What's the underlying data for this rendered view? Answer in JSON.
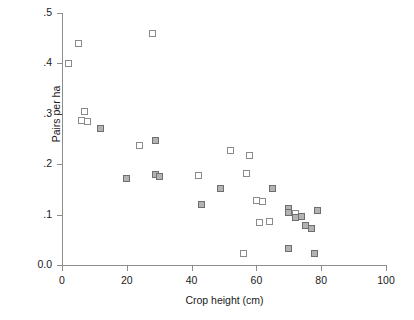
{
  "chart_data": {
    "type": "scatter",
    "title": "",
    "xlabel": "Crop height (cm)",
    "ylabel": "Pairs per ha",
    "xlim": [
      0,
      100
    ],
    "ylim": [
      0.0,
      0.5
    ],
    "xticks": [
      0,
      20,
      40,
      60,
      80,
      100
    ],
    "xtick_labels": [
      "0",
      "20",
      "40",
      "60",
      "80",
      "100"
    ],
    "yticks": [
      0.0,
      0.1,
      0.2,
      0.3,
      0.4,
      0.5
    ],
    "ytick_labels": [
      "0.0",
      ".1",
      ".2",
      ".3",
      ".4",
      ".5"
    ],
    "grid": false,
    "legend": "none",
    "marker_colors": {
      "open": "#ffffff",
      "filled": "#b3b3b3",
      "edge": "#8a8a8a",
      "axis": "#8c8c8c"
    },
    "series": [
      {
        "name": "open-square",
        "marker": "open",
        "points": [
          {
            "x": 5,
            "y": 0.44
          },
          {
            "x": 2,
            "y": 0.4
          },
          {
            "x": 28,
            "y": 0.46
          },
          {
            "x": 7,
            "y": 0.305
          },
          {
            "x": 6,
            "y": 0.287
          },
          {
            "x": 8,
            "y": 0.284
          },
          {
            "x": 24,
            "y": 0.237
          },
          {
            "x": 42,
            "y": 0.178
          },
          {
            "x": 52,
            "y": 0.228
          },
          {
            "x": 58,
            "y": 0.218
          },
          {
            "x": 57,
            "y": 0.182
          },
          {
            "x": 60,
            "y": 0.128
          },
          {
            "x": 62,
            "y": 0.126
          },
          {
            "x": 61,
            "y": 0.085
          },
          {
            "x": 64,
            "y": 0.087
          },
          {
            "x": 56,
            "y": 0.022
          },
          {
            "x": 72,
            "y": 0.102
          }
        ]
      },
      {
        "name": "filled-square",
        "marker": "filled",
        "points": [
          {
            "x": 12,
            "y": 0.27
          },
          {
            "x": 29,
            "y": 0.248
          },
          {
            "x": 20,
            "y": 0.172
          },
          {
            "x": 29,
            "y": 0.18
          },
          {
            "x": 30,
            "y": 0.176
          },
          {
            "x": 43,
            "y": 0.12
          },
          {
            "x": 49,
            "y": 0.152
          },
          {
            "x": 65,
            "y": 0.152
          },
          {
            "x": 70,
            "y": 0.112
          },
          {
            "x": 70,
            "y": 0.104
          },
          {
            "x": 72,
            "y": 0.094
          },
          {
            "x": 74,
            "y": 0.096
          },
          {
            "x": 75,
            "y": 0.079
          },
          {
            "x": 77,
            "y": 0.072
          },
          {
            "x": 79,
            "y": 0.108
          },
          {
            "x": 70,
            "y": 0.033
          },
          {
            "x": 78,
            "y": 0.022
          }
        ]
      }
    ]
  }
}
